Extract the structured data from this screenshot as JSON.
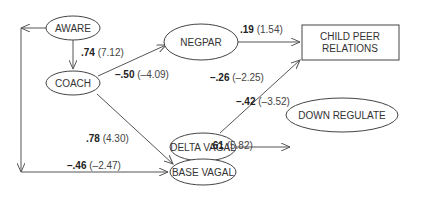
{
  "diagram": {
    "type": "path-model",
    "nodes": [
      {
        "id": "aware",
        "label": "AWARE",
        "shape": "ellipse"
      },
      {
        "id": "coach",
        "label": "COACH",
        "shape": "ellipse"
      },
      {
        "id": "negpar",
        "label": "NEGPAR",
        "shape": "ellipse"
      },
      {
        "id": "delta_vagal",
        "label": "DELTA VAGAL",
        "shape": "ellipse"
      },
      {
        "id": "base_vagal",
        "label": "BASE VAGAL",
        "shape": "ellipse"
      },
      {
        "id": "down_regulate",
        "label": "DOWN REGULATE",
        "shape": "ellipse"
      },
      {
        "id": "child_peer",
        "label_line1": "CHILD PEER",
        "label_line2": "RELATIONS",
        "shape": "rectangle"
      }
    ],
    "edges": [
      {
        "from": "aware",
        "to": "coach",
        "coef": ".74",
        "tval": "(7.12)"
      },
      {
        "from": "coach",
        "to": "negpar",
        "coef": "–.50",
        "tval": "(–4.09)"
      },
      {
        "from": "negpar",
        "to": "child_peer",
        "coef": ".19",
        "tval": "(1.54)"
      },
      {
        "from": "delta_vagal",
        "to": "child_peer",
        "coef": "–.26",
        "tval": "(–2.25)"
      },
      {
        "from": "delta_vagal",
        "to": "down_regulate",
        "coef": "–.42",
        "tval": "(–3.52)"
      },
      {
        "from": "coach",
        "to": "base_vagal",
        "coef": ".78",
        "tval": "(4.30)"
      },
      {
        "from": "base_vagal",
        "to": "delta_vagal",
        "coef": ".61",
        "tval": "(5.82)"
      },
      {
        "from": "aware",
        "to": "base_vagal",
        "coef": "–.46",
        "tval": "(–2.47)",
        "note": "double-headed connector along left side"
      }
    ]
  }
}
